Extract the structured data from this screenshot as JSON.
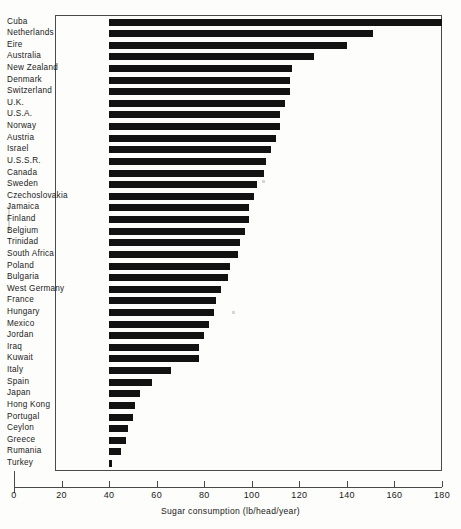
{
  "chart": {
    "type": "bar",
    "orientation": "horizontal",
    "title": "",
    "xlabel": "Sugar consumption (lb/head/year)",
    "ylabel": "",
    "xlim": [
      0,
      180
    ],
    "xticks": [
      0,
      20,
      40,
      60,
      80,
      100,
      120,
      140,
      160,
      180
    ],
    "grid": false,
    "bar_baseline": 40,
    "bar_color": "#121212",
    "frame_color": "#4a4a4a"
  },
  "chart_data": {
    "type": "bar",
    "orientation": "horizontal",
    "title": "",
    "xlabel": "Sugar consumption (lb/head/year)",
    "ylabel": "",
    "xlim": [
      0,
      180
    ],
    "ylim": null,
    "xticks": [
      0,
      20,
      40,
      60,
      80,
      100,
      120,
      140,
      160,
      180
    ],
    "xticklabels": [
      "0",
      "20",
      "40",
      "60",
      "80",
      "100",
      "120",
      "140",
      "160",
      "180"
    ],
    "grid": false,
    "legend": null,
    "note": "Bars are drawn from a left cut-off at 40 lb/head/year to the country value.",
    "categories": [
      "Cuba",
      "Netherlands",
      "Eire",
      "Australia",
      "New Zealand",
      "Denmark",
      "Switzerland",
      "U.K.",
      "U.S.A.",
      "Norway",
      "Austria",
      "Israel",
      "U.S.S.R.",
      "Canada",
      "Sweden",
      "Czechoslovakia",
      "Jamaica",
      "Finland",
      "Belgium",
      "Trinidad",
      "South Africa",
      "Poland",
      "Bulgaria",
      "West Germany",
      "France",
      "Hungary",
      "Mexico",
      "Jordan",
      "Iraq",
      "Kuwait",
      "Italy",
      "Spain",
      "Japan",
      "Hong Kong",
      "Portugal",
      "Ceylon",
      "Greece",
      "Rumania",
      "Turkey"
    ],
    "values": [
      180,
      151,
      140,
      126,
      117,
      116,
      116,
      114,
      112,
      112,
      110,
      108,
      106,
      105,
      102,
      101,
      99,
      99,
      97,
      95,
      94,
      91,
      90,
      87,
      85,
      84,
      82,
      80,
      78,
      78,
      66,
      58,
      53,
      51,
      50,
      48,
      47,
      45,
      41
    ]
  }
}
